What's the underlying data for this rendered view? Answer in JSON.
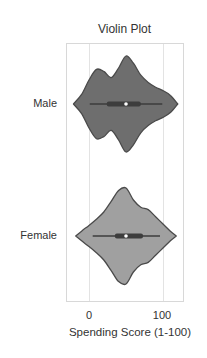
{
  "chart_data": {
    "type": "violin",
    "title": "Violin Plot",
    "xlabel": "Spending Score (1-100)",
    "ylabel": "",
    "xlim": [
      -31,
      127
    ],
    "xticks": [
      0,
      100
    ],
    "xtick_labels": [
      "0",
      "100"
    ],
    "grid": true,
    "orientation": "horizontal",
    "categories": [
      "Male",
      "Female"
    ],
    "series": [
      {
        "name": "Male",
        "color": "#6e6e6e",
        "box": {
          "whisker_low": 1,
          "q1": 24,
          "median": 50,
          "q3": 70,
          "whisker_high": 99
        },
        "density_profile": {
          "x": [
            -21,
            -10,
            0,
            10,
            20,
            30,
            40,
            50,
            60,
            70,
            80,
            90,
            100,
            110,
            120
          ],
          "half_width": [
            0,
            0.2,
            0.5,
            0.72,
            0.68,
            0.55,
            0.75,
            1.0,
            0.85,
            0.6,
            0.45,
            0.35,
            0.28,
            0.18,
            0
          ]
        }
      },
      {
        "name": "Female",
        "color": "#a0a0a0",
        "box": {
          "whisker_low": 5,
          "q1": 35,
          "median": 50,
          "q3": 73,
          "whisker_high": 96
        },
        "density_profile": {
          "x": [
            -18,
            -10,
            0,
            10,
            20,
            30,
            40,
            50,
            60,
            70,
            80,
            90,
            100,
            110,
            118
          ],
          "half_width": [
            0,
            0.1,
            0.22,
            0.35,
            0.5,
            0.72,
            0.95,
            1.0,
            0.75,
            0.6,
            0.55,
            0.4,
            0.25,
            0.1,
            0
          ]
        }
      }
    ]
  },
  "labels": {
    "title": "Violin Plot",
    "xlabel": "Spending Score (1-100)",
    "xtick_0": "0",
    "xtick_100": "100",
    "cat_male": "Male",
    "cat_female": "Female"
  }
}
